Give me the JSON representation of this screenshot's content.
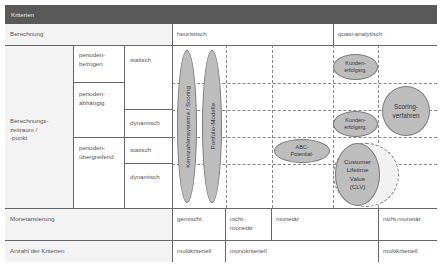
{
  "header": {
    "title": "Kriterien"
  },
  "rows": {
    "berechnung": {
      "label": "Berechnung",
      "heuristic": "heuristisch",
      "quasi": "quasi-analytisch"
    },
    "zeitraum": {
      "label": "Berechnungs-\nzeitraum /\n-punkt",
      "periods": [
        {
          "label": "perioden-\nbezogen"
        },
        {
          "label": "perioden-\nabhängig"
        },
        {
          "label": "perioden-\nübergreifend"
        }
      ],
      "modes": [
        "statisch",
        "dynamisch",
        "statisch",
        "dynamisch"
      ]
    },
    "monetarisierung": {
      "label": "Monetarisierung",
      "values": [
        "gemischt",
        "nicht-\nmonetär",
        "monetär",
        "nicht-monetär"
      ]
    },
    "anzahl": {
      "label": "Anzahl der Kriterien",
      "values": [
        "multikriteriell",
        "monokriteriell",
        "multikriteriell"
      ]
    }
  },
  "methods": {
    "kennzahlen": "Kennzahlensysteme / Scoring",
    "portfolio": "Portfolio-Modelle",
    "kunden1": "Kunden-\nerfolgsrg.",
    "kunden2": "Kunden-\nerfolgsrg.",
    "scoring": "Scoring-\nverfahren",
    "abc": "ABC-\nPotential-",
    "clv": "Customer\nLifetime\nValue\n(CLV)"
  }
}
